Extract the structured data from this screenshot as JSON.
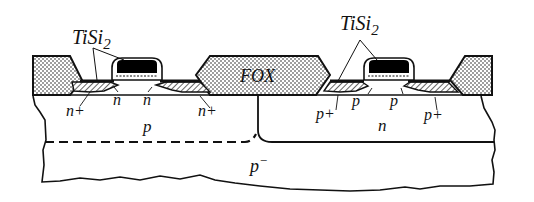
{
  "diagram": {
    "labels": {
      "tisi2_left": "TiSi",
      "tisi2_left_sub": "2",
      "tisi2_right": "TiSi",
      "tisi2_right_sub": "2",
      "fox": "FOX",
      "nmos_source": "n+",
      "nmos_ldd_left": "n",
      "nmos_ldd_right": "n",
      "nmos_drain": "n+",
      "pmos_source": "p+",
      "pmos_ldd_left": "p",
      "pmos_ldd_right": "p",
      "pmos_drain": "p+",
      "p_well": "p",
      "n_well": "n",
      "substrate": "p",
      "substrate_sup": "−"
    },
    "regions": [
      "field-oxide-left",
      "field-oxide-center",
      "field-oxide-right",
      "nmos-gate",
      "pmos-gate",
      "n-plus-source-drain",
      "p-plus-source-drain",
      "p-well",
      "n-well",
      "p-minus-substrate"
    ]
  }
}
